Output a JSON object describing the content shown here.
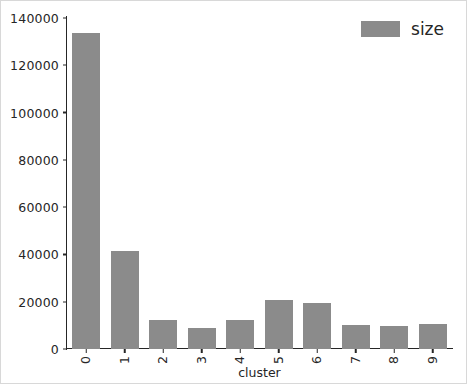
{
  "chart_data": {
    "type": "bar",
    "title": "",
    "xlabel": "cluster",
    "ylabel": "",
    "categories": [
      "0",
      "1",
      "2",
      "3",
      "4",
      "5",
      "6",
      "7",
      "8",
      "9"
    ],
    "values": [
      133500,
      41400,
      12100,
      9000,
      12300,
      20800,
      19300,
      10200,
      9900,
      10600
    ],
    "series": [
      {
        "name": "size",
        "color": "#8b8b8b",
        "values": [
          133500,
          41400,
          12100,
          9000,
          12300,
          20800,
          19300,
          10200,
          9900,
          10600
        ]
      }
    ],
    "ylim": [
      0,
      140000
    ],
    "yticks": [
      0,
      20000,
      40000,
      60000,
      80000,
      100000,
      120000,
      140000
    ],
    "ytick_labels": [
      "0",
      "20000",
      "40000",
      "60000",
      "80000",
      "100000",
      "120000",
      "140000"
    ],
    "xtick_rotation": 90,
    "grid": false,
    "legend": {
      "position": "upper-right",
      "entries": [
        {
          "label": "size",
          "color": "#8b8b8b"
        }
      ]
    },
    "spines": [
      "left",
      "bottom"
    ],
    "bar_color": "#8b8b8b",
    "axis_color": "#262626",
    "background": "#ffffff"
  }
}
